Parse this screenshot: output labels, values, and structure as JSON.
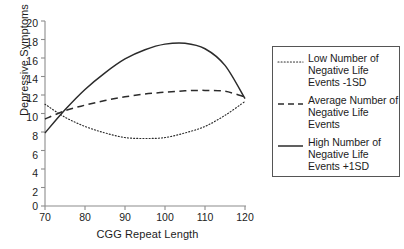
{
  "chart_data": {
    "type": "line",
    "title": "",
    "xlabel": "CGG Repeat Length",
    "ylabel": "Depressive Symptoms",
    "xlim": [
      70,
      120
    ],
    "ylim": [
      0,
      20
    ],
    "xticks": [
      "70",
      "80",
      "90",
      "100",
      "110",
      "120"
    ],
    "yticks": [
      "0",
      "2",
      "4",
      "6",
      "8",
      "10",
      "12",
      "14",
      "16",
      "18",
      "20"
    ],
    "grid": false,
    "legend_position": "right",
    "x": [
      70,
      75,
      80,
      85,
      90,
      95,
      100,
      105,
      110,
      115,
      120
    ],
    "series": [
      {
        "name": "Low Number of Negative Life Events -1SD",
        "style": "dotted",
        "values": [
          11.0,
          9.6,
          8.6,
          7.9,
          7.4,
          7.3,
          7.4,
          7.9,
          8.6,
          9.8,
          11.3
        ]
      },
      {
        "name": "Average Number of Negative Life Events",
        "style": "dashed",
        "values": [
          9.4,
          10.3,
          10.9,
          11.4,
          11.8,
          12.1,
          12.3,
          12.45,
          12.5,
          12.4,
          11.8
        ]
      },
      {
        "name": "High Number of Negative Life Events +1SD",
        "style": "solid",
        "values": [
          7.9,
          10.4,
          12.6,
          14.4,
          15.9,
          16.9,
          17.5,
          17.6,
          17.0,
          15.2,
          11.6
        ]
      }
    ],
    "colors": {
      "axis": "#8c8c8c",
      "text": "#1c1c1c",
      "line": "#2b2b2b",
      "legend_border": "#555555",
      "background": "#ffffff"
    }
  },
  "legend": {
    "entries": [
      {
        "label": "Low Number of Negative Life Events -1SD",
        "style": "dotted"
      },
      {
        "label": "Average Number of Negative Life Events",
        "style": "dashed"
      },
      {
        "label": "High Number of Negative Life Events +1SD",
        "style": "solid"
      }
    ]
  }
}
